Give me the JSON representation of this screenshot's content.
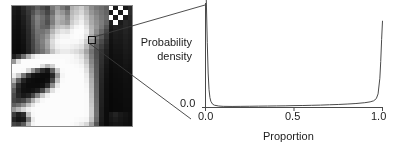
{
  "figure": {
    "panel_left_name": "pixelated-grayscale-image",
    "panel_right_name": "probability-density-plot"
  },
  "ylabel_line1": "Probability",
  "ylabel_line2": "density",
  "chart_data": {
    "type": "line",
    "title": "",
    "subtitle": "",
    "xlabel": "Proportion",
    "ylabel": "Probability density",
    "xlim": [
      0.0,
      1.0
    ],
    "ylim": [
      0.0,
      1.0
    ],
    "grid": false,
    "legend": "none",
    "xticks": [
      0.0,
      0.5,
      1.0
    ],
    "xticklabels": [
      "0.0",
      "0.5",
      "1.0"
    ],
    "yticks": [
      0.0
    ],
    "yticklabels": [
      "0.0"
    ],
    "annotation": "U-shaped (bimodal beta-like) density: sharp spikes at proportion 0.0 and 1.0, near-zero in between",
    "series": [
      {
        "name": "probability density",
        "x": [
          0.0,
          0.005,
          0.01,
          0.015,
          0.02,
          0.025,
          0.03,
          0.04,
          0.05,
          0.075,
          0.1,
          0.15,
          0.2,
          0.25,
          0.3,
          0.35,
          0.4,
          0.45,
          0.5,
          0.55,
          0.6,
          0.65,
          0.7,
          0.75,
          0.8,
          0.85,
          0.9,
          0.93,
          0.95,
          0.965,
          0.975,
          0.985,
          0.99,
          0.995,
          1.0
        ],
        "y": [
          1.23,
          1.0,
          0.62,
          0.33,
          0.17,
          0.095,
          0.06,
          0.032,
          0.022,
          0.014,
          0.011,
          0.01,
          0.011,
          0.012,
          0.013,
          0.014,
          0.015,
          0.016,
          0.018,
          0.019,
          0.021,
          0.023,
          0.026,
          0.029,
          0.033,
          0.038,
          0.046,
          0.054,
          0.064,
          0.085,
          0.13,
          0.28,
          0.44,
          0.65,
          0.83
        ]
      }
    ]
  },
  "pixel_image": {
    "name": "pixelated-grayscale-image",
    "grid_cols": 25,
    "grid_rows": 25,
    "description": "25x25 coarse grayscale raster, dark upper-left region, bright white blob lower-centre, dark band right side, checkered black-and-white cells top-right corner",
    "rows": [
      [
        30,
        25,
        40,
        60,
        70,
        95,
        75,
        60,
        120,
        150,
        120,
        95,
        175,
        190,
        205,
        175,
        140,
        120,
        110,
        95,
        255,
        25,
        255,
        25,
        40
      ],
      [
        25,
        20,
        35,
        55,
        80,
        110,
        95,
        70,
        110,
        165,
        150,
        120,
        185,
        200,
        215,
        185,
        150,
        130,
        115,
        100,
        25,
        255,
        25,
        255,
        45
      ],
      [
        22,
        18,
        30,
        50,
        95,
        130,
        110,
        85,
        130,
        180,
        170,
        140,
        195,
        215,
        230,
        200,
        165,
        140,
        120,
        105,
        255,
        25,
        255,
        25,
        40
      ],
      [
        20,
        16,
        28,
        48,
        90,
        125,
        105,
        80,
        125,
        175,
        165,
        150,
        205,
        225,
        240,
        210,
        170,
        145,
        125,
        100,
        30,
        255,
        25,
        40,
        35
      ],
      [
        18,
        15,
        25,
        45,
        85,
        120,
        100,
        95,
        150,
        190,
        200,
        190,
        225,
        245,
        250,
        225,
        180,
        150,
        120,
        85,
        25,
        35,
        30,
        38,
        32
      ],
      [
        16,
        14,
        22,
        42,
        80,
        115,
        115,
        130,
        180,
        215,
        230,
        225,
        245,
        252,
        252,
        235,
        185,
        140,
        105,
        70,
        22,
        30,
        28,
        35,
        30
      ],
      [
        15,
        13,
        20,
        40,
        75,
        110,
        125,
        150,
        205,
        235,
        245,
        245,
        250,
        252,
        250,
        225,
        170,
        125,
        90,
        55,
        20,
        28,
        26,
        32,
        28
      ],
      [
        14,
        12,
        18,
        38,
        70,
        105,
        130,
        165,
        220,
        245,
        250,
        250,
        248,
        248,
        240,
        205,
        150,
        105,
        75,
        45,
        18,
        25,
        24,
        30,
        26
      ],
      [
        13,
        11,
        16,
        36,
        68,
        100,
        125,
        160,
        215,
        240,
        245,
        245,
        240,
        235,
        225,
        185,
        130,
        90,
        62,
        38,
        16,
        22,
        22,
        28,
        25
      ],
      [
        12,
        10,
        15,
        34,
        65,
        95,
        115,
        145,
        195,
        225,
        235,
        235,
        228,
        220,
        205,
        165,
        115,
        78,
        52,
        32,
        15,
        20,
        20,
        26,
        24
      ],
      [
        30,
        55,
        110,
        175,
        225,
        245,
        250,
        250,
        250,
        250,
        250,
        250,
        248,
        240,
        225,
        185,
        125,
        80,
        50,
        28,
        14,
        18,
        18,
        24,
        22
      ],
      [
        150,
        225,
        252,
        252,
        252,
        252,
        252,
        252,
        252,
        252,
        252,
        250,
        248,
        245,
        235,
        200,
        135,
        85,
        48,
        25,
        13,
        16,
        17,
        22,
        20
      ],
      [
        252,
        252,
        252,
        252,
        252,
        250,
        220,
        180,
        210,
        252,
        252,
        252,
        252,
        250,
        245,
        215,
        145,
        88,
        45,
        22,
        12,
        15,
        16,
        20,
        18
      ],
      [
        252,
        252,
        250,
        215,
        150,
        90,
        45,
        25,
        95,
        200,
        250,
        252,
        252,
        252,
        250,
        225,
        155,
        90,
        42,
        20,
        11,
        14,
        15,
        18,
        17
      ],
      [
        240,
        200,
        120,
        55,
        22,
        15,
        12,
        12,
        40,
        150,
        245,
        252,
        252,
        252,
        252,
        235,
        165,
        92,
        40,
        18,
        10,
        13,
        14,
        17,
        16
      ],
      [
        180,
        95,
        35,
        15,
        12,
        10,
        10,
        15,
        70,
        190,
        250,
        252,
        252,
        252,
        252,
        240,
        175,
        95,
        38,
        16,
        10,
        12,
        13,
        16,
        15
      ],
      [
        120,
        45,
        18,
        12,
        12,
        12,
        15,
        45,
        140,
        230,
        252,
        252,
        252,
        252,
        252,
        245,
        180,
        98,
        36,
        15,
        9,
        12,
        12,
        15,
        15
      ],
      [
        90,
        35,
        16,
        14,
        18,
        30,
        70,
        150,
        225,
        250,
        252,
        252,
        252,
        252,
        252,
        248,
        185,
        100,
        35,
        14,
        9,
        11,
        12,
        14,
        14
      ],
      [
        75,
        40,
        25,
        35,
        70,
        130,
        200,
        240,
        252,
        252,
        252,
        252,
        252,
        252,
        252,
        250,
        190,
        102,
        34,
        14,
        8,
        11,
        11,
        14,
        14
      ],
      [
        70,
        60,
        70,
        110,
        175,
        225,
        248,
        252,
        252,
        252,
        252,
        252,
        252,
        252,
        252,
        250,
        195,
        105,
        33,
        13,
        8,
        10,
        11,
        13,
        13
      ],
      [
        95,
        110,
        140,
        190,
        230,
        250,
        252,
        252,
        252,
        252,
        252,
        252,
        252,
        252,
        252,
        250,
        200,
        108,
        32,
        13,
        8,
        10,
        10,
        13,
        13
      ],
      [
        150,
        180,
        215,
        240,
        250,
        252,
        252,
        252,
        252,
        252,
        252,
        252,
        252,
        252,
        252,
        250,
        205,
        110,
        30,
        12,
        8,
        10,
        10,
        12,
        12
      ],
      [
        60,
        30,
        45,
        190,
        248,
        252,
        252,
        252,
        252,
        252,
        252,
        252,
        252,
        252,
        252,
        250,
        205,
        112,
        30,
        12,
        25,
        35,
        25,
        20,
        15
      ],
      [
        35,
        20,
        25,
        120,
        235,
        252,
        252,
        252,
        252,
        252,
        252,
        252,
        252,
        250,
        248,
        245,
        195,
        105,
        28,
        12,
        22,
        28,
        22,
        18,
        14
      ],
      [
        70,
        60,
        90,
        180,
        245,
        252,
        252,
        252,
        252,
        252,
        252,
        252,
        250,
        245,
        235,
        215,
        160,
        85,
        25,
        11,
        18,
        22,
        20,
        16,
        14
      ]
    ]
  }
}
